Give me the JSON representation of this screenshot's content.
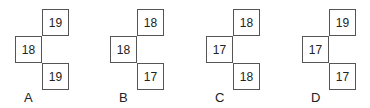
{
  "figures": [
    {
      "label": "A",
      "top": "19",
      "left": "18",
      "bottom": "19"
    },
    {
      "label": "B",
      "top": "18",
      "left": "18",
      "bottom": "17"
    },
    {
      "label": "C",
      "top": "18",
      "left": "17",
      "bottom": "18"
    },
    {
      "label": "D",
      "top": "19",
      "left": "17",
      "bottom": "17"
    }
  ]
}
